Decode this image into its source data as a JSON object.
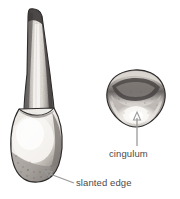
{
  "figure": {
    "background": "#ffffff",
    "style": "grayscale pencil/ink anatomical drawing",
    "width": 180,
    "height": 199
  },
  "labels": {
    "cingulum": "cingulum",
    "slanted_edge": "slanted edge",
    "text_color": "#4a4a4a",
    "leader_color": "#9a9a9a"
  },
  "views": [
    {
      "name": "facial-view",
      "description": "full single-rooted tooth, long tapering root above, bulbous crown below with slanted incisal edge",
      "bbox": [
        10,
        8,
        70,
        182
      ]
    },
    {
      "name": "incisal-view",
      "description": "rounded heart-shaped occlusal/incisal outline with marginal ridges and central cingulum bulge",
      "bbox": [
        104,
        70,
        166,
        128
      ]
    }
  ],
  "leaders": [
    {
      "name": "cingulum-leader",
      "from": [
        137,
        146
      ],
      "to": [
        137,
        117
      ],
      "arrow": "up"
    },
    {
      "name": "slanted-edge-leader",
      "from": [
        74,
        182
      ],
      "to": [
        46,
        172
      ],
      "arrow": "up-left"
    }
  ],
  "palette": {
    "ink_dark": "#2e2e2e",
    "ink_mid": "#6f6f6f",
    "ink_light": "#b9b9b9",
    "enamel_highlight": "#f4f2ef",
    "paper": "#ffffff"
  }
}
